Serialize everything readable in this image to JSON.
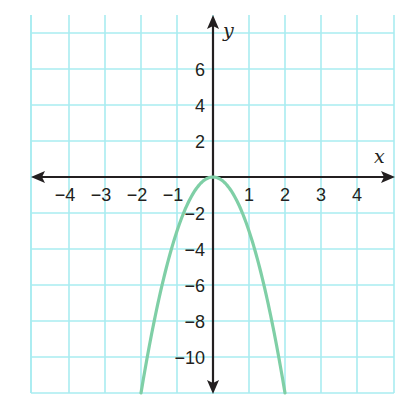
{
  "chart_data": {
    "type": "line",
    "title": "",
    "xlabel": "x",
    "ylabel": "y",
    "xlim": [
      -5,
      5
    ],
    "ylim": [
      -12,
      9
    ],
    "grid": true,
    "x_ticks": [
      -4,
      -3,
      -2,
      -1,
      1,
      2,
      3,
      4
    ],
    "y_ticks": [
      -10,
      -8,
      -6,
      -4,
      -2,
      2,
      4,
      6
    ],
    "x_tick_labels": [
      "−4",
      "−3",
      "−2",
      "−1",
      "1",
      "2",
      "3",
      "4"
    ],
    "y_tick_labels": [
      "−10",
      "−8",
      "−6",
      "−4",
      "−2",
      "2",
      "4",
      "6"
    ],
    "series": [
      {
        "name": "y = -3x^2",
        "color": "#7fcfa6",
        "x": [
          -2,
          -1.5,
          -1,
          -0.5,
          0,
          0.5,
          1,
          1.5,
          2
        ],
        "y": [
          -12,
          -6.75,
          -3,
          -0.75,
          0,
          -0.75,
          -3,
          -6.75,
          -12
        ]
      }
    ]
  },
  "colors": {
    "grid": "#a9ecf0",
    "axis": "#231f20",
    "curve": "#7fcfa6"
  }
}
